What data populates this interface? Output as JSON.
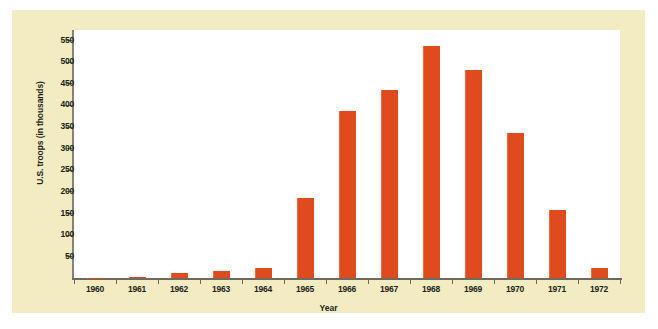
{
  "chart_data": {
    "type": "bar",
    "title": "",
    "subtitle": "",
    "xlabel": "Year",
    "ylabel": "U.S. troops (in thousands)",
    "categories": [
      "1960",
      "1961",
      "1962",
      "1963",
      "1964",
      "1965",
      "1966",
      "1967",
      "1968",
      "1969",
      "1970",
      "1971",
      "1972"
    ],
    "values": [
      1,
      3,
      11,
      16,
      23,
      184,
      385,
      435,
      537,
      480,
      335,
      158,
      24
    ],
    "ylim": [
      0,
      550
    ],
    "y_ticks": [
      550,
      500,
      450,
      400,
      350,
      300,
      250,
      200,
      150,
      100,
      50
    ],
    "y_tick_labels": [
      "550",
      "500",
      "450",
      "400",
      "350",
      "300",
      "250",
      "200",
      "150",
      "100",
      "50"
    ],
    "grid": false,
    "legend": null,
    "legend_position": "none",
    "series": [
      {
        "name": "U.S. troops",
        "values": [
          1,
          3,
          11,
          16,
          23,
          184,
          385,
          435,
          537,
          480,
          335,
          158,
          24
        ]
      }
    ],
    "annotations": []
  },
  "colors": {
    "bar": "#e04a1f",
    "bar_highlight": "#ef6a3c",
    "panel_background": "#f3ecc2",
    "plot_background": "#ffffff",
    "axis": "#6f6a60",
    "text": "#231f18"
  }
}
